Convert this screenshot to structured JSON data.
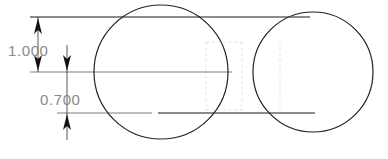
{
  "drawing": {
    "title": "Dimensioned two-circle technical drawing",
    "background_color": "#ffffff",
    "width": 388,
    "height": 159,
    "line_color": "#1a1a1a",
    "text_color": "#8a8a8a",
    "hidden_line_color": "#dedede"
  },
  "dimensions": [
    {
      "id": "vertical-1000",
      "label": "1.000",
      "value": 1.0,
      "units": "in",
      "orientation": "vertical",
      "from_y": 17,
      "to_y": 72,
      "arrow_x": 38,
      "text_x": 8,
      "text_y": 51,
      "arrow_direction_top": "up",
      "arrow_direction_bottom": "down"
    },
    {
      "id": "vertical-0700",
      "label": "0.700",
      "value": 0.7,
      "units": "in",
      "orientation": "vertical",
      "from_y": 72,
      "to_y": 113,
      "arrow_x": 67,
      "text_x": 40,
      "text_y": 100,
      "arrow_direction_top": "down",
      "arrow_direction_bottom": "up"
    }
  ],
  "geometry": {
    "circles": [
      {
        "id": "left-circle",
        "cx": 161,
        "cy": 72,
        "r": 67
      },
      {
        "id": "right-circle",
        "cx": 313,
        "cy": 72,
        "r": 60
      }
    ],
    "horizontal_lines": [
      {
        "id": "top-outline",
        "x1": 30,
        "x2": 310,
        "y": 17
      },
      {
        "id": "center-line",
        "x1": 30,
        "x2": 232,
        "y": 72
      },
      {
        "id": "bottom-outline-left",
        "x1": 57,
        "x2": 152,
        "y": 113
      },
      {
        "id": "bottom-outline-right",
        "x1": 158,
        "x2": 315,
        "y": 113
      }
    ],
    "hidden_rectangle": {
      "x": 205,
      "y": 42,
      "width": 37,
      "height": 68
    }
  }
}
